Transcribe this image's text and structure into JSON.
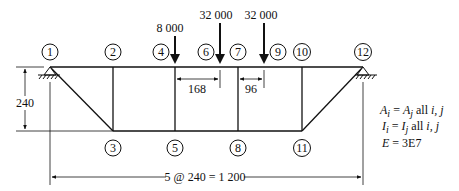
{
  "diagram": {
    "type": "truss",
    "nodes": [
      {
        "id": "1",
        "x": 50,
        "y": 67,
        "label_x": 50,
        "label_y": 50
      },
      {
        "id": "2",
        "x": 113,
        "y": 67,
        "label_x": 113,
        "label_y": 50
      },
      {
        "id": "3",
        "x": 113,
        "y": 131,
        "label_x": 113,
        "label_y": 148
      },
      {
        "id": "4",
        "x": 175,
        "y": 67,
        "label_x": 161,
        "label_y": 50
      },
      {
        "id": "5",
        "x": 175,
        "y": 131,
        "label_x": 175,
        "label_y": 148
      },
      {
        "id": "6",
        "x": 206,
        "y": 67,
        "label_x": 206,
        "label_y": 50
      },
      {
        "id": "7",
        "x": 238,
        "y": 67,
        "label_x": 238,
        "label_y": 50
      },
      {
        "id": "8",
        "x": 238,
        "y": 131,
        "label_x": 238,
        "label_y": 148
      },
      {
        "id": "9",
        "x": 278,
        "y": 67,
        "label_x": 278,
        "label_y": 50
      },
      {
        "id": "10",
        "x": 302,
        "y": 67,
        "label_x": 302,
        "label_y": 50
      },
      {
        "id": "11",
        "x": 302,
        "y": 131,
        "label_x": 302,
        "label_y": 148
      },
      {
        "id": "12",
        "x": 363,
        "y": 67,
        "label_x": 363,
        "label_y": 50
      }
    ],
    "loads": [
      {
        "label": "8 000",
        "x": 175,
        "top": 36,
        "text_y": 32
      },
      {
        "label": "32 000",
        "x": 220,
        "top": 23,
        "text_y": 19
      },
      {
        "label": "32 000",
        "x": 264,
        "top": 23,
        "text_y": 19
      }
    ],
    "dimensions": {
      "height": "240",
      "load_spacing_1": "168",
      "load_spacing_2": "96",
      "span": "5 @ 240 = 1 200"
    },
    "properties": {
      "line1_lhs": "A",
      "line1_lhs_sub": "i",
      "line1_eq": " = ",
      "line1_rhs": "A",
      "line1_rhs_sub": "j",
      "line1_tail": " all ",
      "line1_vars": "i, j",
      "line2_lhs": "I",
      "line2_lhs_sub": "i",
      "line2_eq": " = ",
      "line2_rhs": "I",
      "line2_rhs_sub": "j",
      "line2_tail": " all ",
      "line2_vars": "i, j",
      "line3_lhs": "E",
      "line3_rhs": " = 3E7"
    }
  }
}
